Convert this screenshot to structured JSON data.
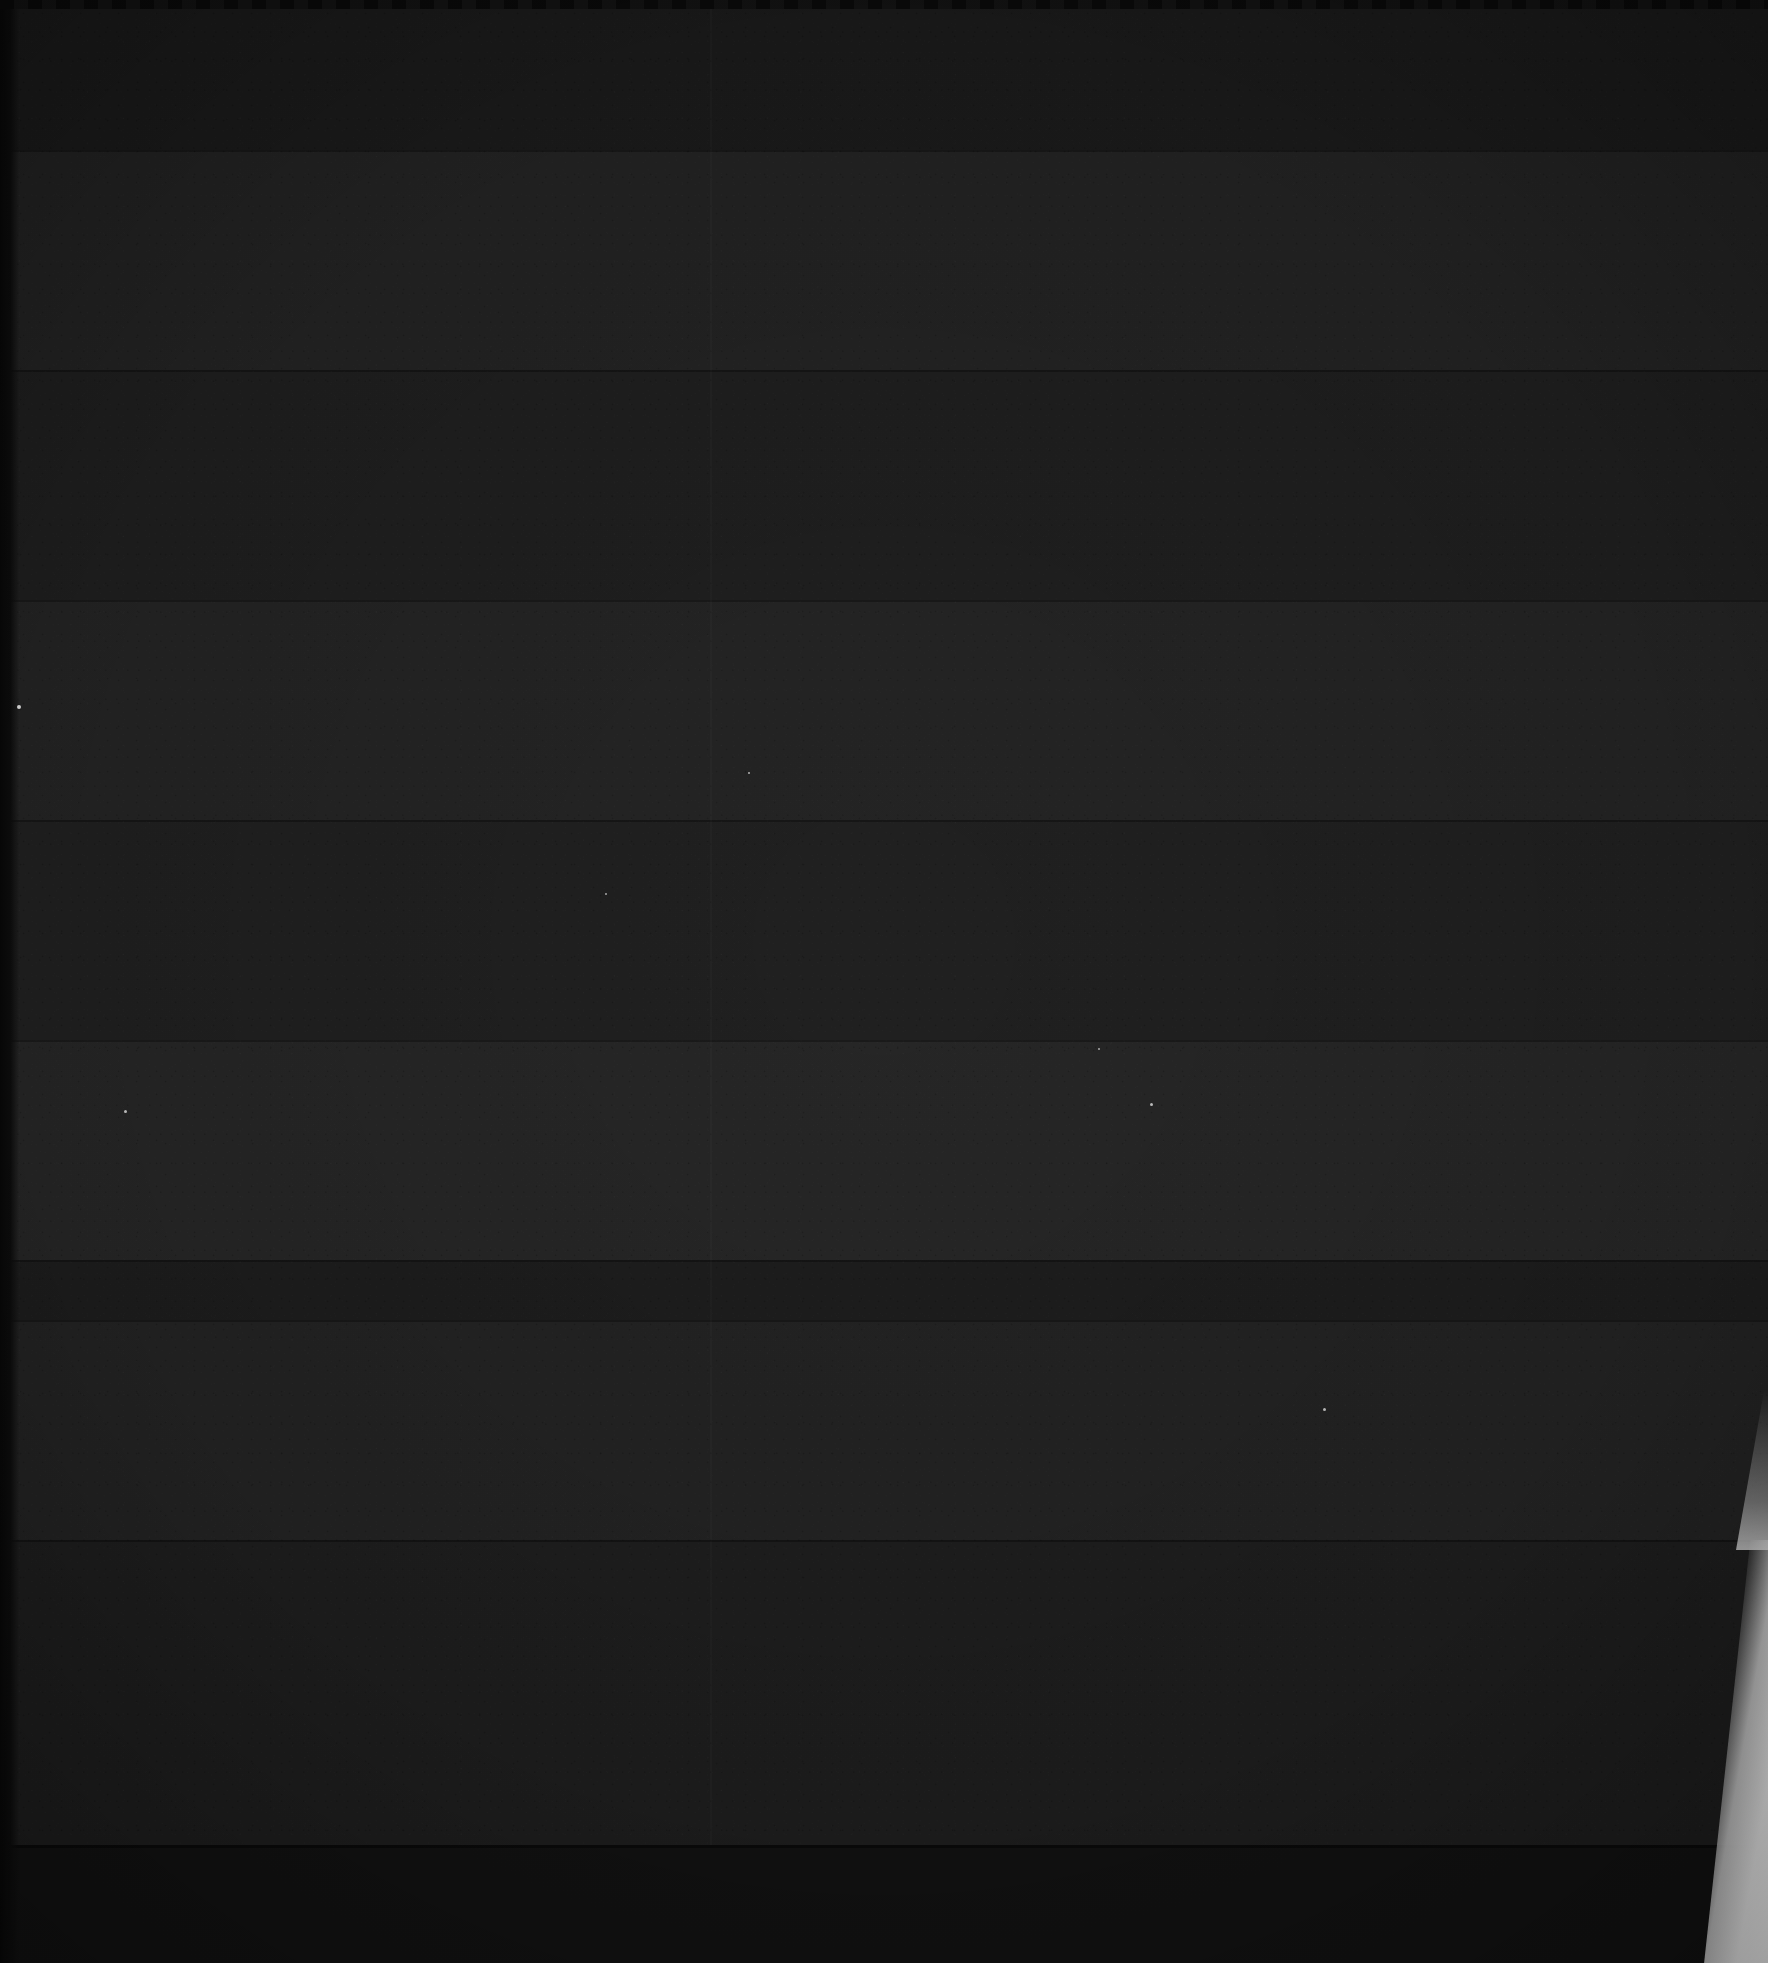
{
  "image": {
    "kind": "underexposed-photograph",
    "width": 1768,
    "height": 1963,
    "visible_text": "",
    "description": "Near-black heavily underexposed frame with horizontal scan banding and a bright wedge of light at the lower right edge",
    "dominant_color": "#212121",
    "background_color": "#1e1e1e"
  },
  "regions": {
    "base_field": {
      "name": "dark-noise-field",
      "color": "#212121",
      "note": "fills entire frame, fine sensor grain"
    },
    "bands": [
      {
        "name": "band-1",
        "top": 0,
        "height": 150,
        "color": "#1b1b1b"
      },
      {
        "name": "band-2",
        "top": 150,
        "height": 220,
        "color": "#232323"
      },
      {
        "name": "band-3",
        "top": 370,
        "height": 230,
        "color": "#1f1f1f"
      },
      {
        "name": "band-4",
        "top": 600,
        "height": 220,
        "color": "#242424"
      },
      {
        "name": "band-5",
        "top": 820,
        "height": 220,
        "color": "#202020"
      },
      {
        "name": "band-6",
        "top": 1040,
        "height": 220,
        "color": "#262626"
      },
      {
        "name": "band-7",
        "top": 1260,
        "height": 60,
        "color": "#1d1d1d"
      },
      {
        "name": "band-8",
        "top": 1320,
        "height": 220,
        "color": "#232323"
      },
      {
        "name": "band-9",
        "top": 1540,
        "height": 305,
        "color": "#1e1e1e"
      }
    ],
    "vertical_seam": {
      "name": "vertical-seam",
      "x": 710,
      "color": "#2a2a2a"
    },
    "left_edge_strip": {
      "name": "left-edge-strip",
      "x": 0,
      "width": 19,
      "color": "#0a0a0a"
    },
    "top_edge_scallop": {
      "name": "top-edge-scallop",
      "height": 9,
      "color": "#0c0c0c"
    },
    "bottom_band": {
      "name": "bottom-dark-band",
      "top": 1845,
      "height": 118,
      "color": "#121212"
    },
    "right_wedge": {
      "name": "bright-light-wedge",
      "x": 1700,
      "y": 1540,
      "width": 68,
      "height": 423,
      "color": "#f2f2f2"
    },
    "specks": [
      {
        "name": "speck-1",
        "x": 17,
        "y": 705,
        "size": 4,
        "color": "#e8e8e8"
      },
      {
        "name": "speck-2",
        "x": 124,
        "y": 1110,
        "size": 3,
        "color": "#d8d8d8"
      },
      {
        "name": "speck-3",
        "x": 1150,
        "y": 1103,
        "size": 2.5,
        "color": "#d0d0d0"
      },
      {
        "name": "speck-4",
        "x": 748,
        "y": 772,
        "size": 2,
        "color": "#c8c8c8"
      },
      {
        "name": "speck-5",
        "x": 1323,
        "y": 1408,
        "size": 2.5,
        "color": "#d4d4d4"
      },
      {
        "name": "speck-6",
        "x": 1098,
        "y": 1048,
        "size": 2,
        "color": "#cccccc"
      },
      {
        "name": "speck-7",
        "x": 605,
        "y": 893,
        "size": 2,
        "color": "#c0c0c0"
      }
    ]
  }
}
